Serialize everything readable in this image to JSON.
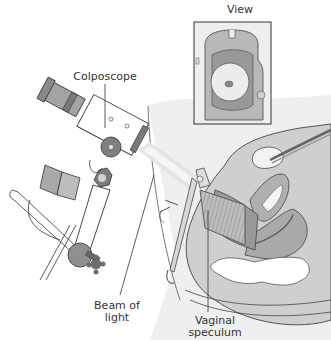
{
  "figure": {
    "labels": {
      "view": "View",
      "colposcope": "Colposcope",
      "beam_line1": "Beam of",
      "beam_line2": "light",
      "speculum_line1": "Vaginal",
      "speculum_line2": "speculum"
    },
    "colors": {
      "background": "#ffffff",
      "outline": "#333333",
      "tissue_light": "#d4d4d4",
      "tissue_mid": "#b5b5b5",
      "tissue_dark": "#8f8f8f",
      "instrument_dark": "#7a7a7a",
      "beam": "#e6e6e6"
    }
  }
}
